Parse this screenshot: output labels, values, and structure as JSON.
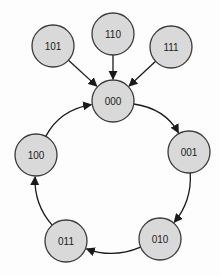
{
  "diagram": {
    "title": "",
    "nodes": [
      {
        "id": "101",
        "label": "101"
      },
      {
        "id": "110",
        "label": "110"
      },
      {
        "id": "111",
        "label": "111"
      },
      {
        "id": "000",
        "label": "000"
      },
      {
        "id": "001",
        "label": "001"
      },
      {
        "id": "010",
        "label": "010"
      },
      {
        "id": "011",
        "label": "011"
      },
      {
        "id": "100",
        "label": "100"
      }
    ],
    "edges": [
      {
        "from": "101",
        "to": "000"
      },
      {
        "from": "110",
        "to": "000"
      },
      {
        "from": "111",
        "to": "000"
      },
      {
        "from": "000",
        "to": "001"
      },
      {
        "from": "001",
        "to": "010"
      },
      {
        "from": "010",
        "to": "011"
      },
      {
        "from": "011",
        "to": "100"
      },
      {
        "from": "100",
        "to": "000"
      }
    ],
    "colors": {
      "node_fill": "#d9d9d9",
      "node_stroke": "#3a3a3a",
      "edge": "#1a1a1a"
    }
  }
}
